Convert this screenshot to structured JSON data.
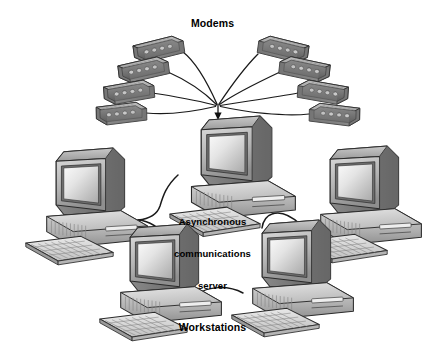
{
  "diagram": {
    "type": "network-topology",
    "background_color": "#ffffff",
    "style": "grayscale line art"
  },
  "labels": {
    "modems": "Modems",
    "server_line1": "Asynchronous",
    "server_line2": "communications",
    "server_line3": "server",
    "server_full": "Asynchronous communications server",
    "workstations": "Workstations"
  },
  "colors": {
    "line": "#1a1a1a",
    "outline": "#2b2b2b",
    "case_light": "#e2e2e2",
    "case_mid": "#b8b8b8",
    "case_dark": "#7e7e7e",
    "case_shadow": "#5a5a5a",
    "screen_light": "#f2f2f2",
    "screen_mid": "#bdbdbd",
    "modem_face": "#6f6f6f",
    "modem_top": "#a9a9a9",
    "text": "#000000"
  },
  "nodes": {
    "modems": [
      {
        "id": "modem-left-1",
        "side": "left",
        "x": 132,
        "y": 44,
        "rotation": -8,
        "lights": 3
      },
      {
        "id": "modem-left-2",
        "side": "left",
        "x": 117,
        "y": 64,
        "rotation": -8,
        "lights": 3
      },
      {
        "id": "modem-left-3",
        "side": "left",
        "x": 103,
        "y": 85,
        "rotation": -5,
        "lights": 3
      },
      {
        "id": "modem-left-4",
        "side": "left",
        "x": 96,
        "y": 105,
        "rotation": -2,
        "lights": 3
      },
      {
        "id": "modem-right-1",
        "side": "right",
        "x": 260,
        "y": 46,
        "rotation": 8,
        "lights": 4
      },
      {
        "id": "modem-right-2",
        "side": "right",
        "x": 282,
        "y": 64,
        "rotation": 6,
        "lights": 4
      },
      {
        "id": "modem-right-3",
        "side": "right",
        "x": 300,
        "y": 85,
        "rotation": 4,
        "lights": 4
      },
      {
        "id": "modem-right-4",
        "side": "right",
        "x": 311,
        "y": 106,
        "rotation": 1,
        "lights": 4
      }
    ],
    "server": {
      "id": "server-computer",
      "x": 170,
      "y": 112,
      "scale": 1.0
    },
    "workstations": [
      {
        "id": "workstation-left",
        "x": 28,
        "y": 152,
        "scale": 0.92
      },
      {
        "id": "workstation-right",
        "x": 300,
        "y": 150,
        "scale": 0.92
      },
      {
        "id": "workstation-bottom-left",
        "x": 100,
        "y": 228,
        "scale": 0.92
      },
      {
        "id": "workstation-bottom-right",
        "x": 232,
        "y": 224,
        "scale": 0.92
      }
    ]
  },
  "connections": {
    "convergence_point": {
      "x": 218,
      "y": 106
    },
    "arrow": {
      "x": 218,
      "y": 114,
      "direction": "down"
    },
    "modem_links": 8,
    "workstation_links": 5
  }
}
